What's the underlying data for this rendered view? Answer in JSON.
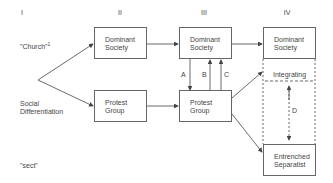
{
  "columns": [
    "I",
    "II",
    "III",
    "IV"
  ],
  "row_labels": {
    "church": "\"Church\"",
    "church_footnote": "1",
    "social_differentiation_line1": "Social",
    "social_differentiation_line2": "Differentiation",
    "sect": "\"sect\""
  },
  "boxes": {
    "dominant_society_ii": [
      "Dominant",
      "Society"
    ],
    "protest_group_ii": [
      "Protest",
      "Group"
    ],
    "dominant_society_iii": [
      "Dominant",
      "Society"
    ],
    "protest_group_iii": [
      "Protest",
      "Group"
    ],
    "dominant_society_iv": [
      "Dominant",
      "Society"
    ],
    "integrating_iv": "Integrating",
    "entrenched_separatist_iv": [
      "Entrenched",
      "Separatist"
    ]
  },
  "arrow_labels": {
    "a": "A",
    "b": "B",
    "c": "C",
    "d": "D"
  }
}
